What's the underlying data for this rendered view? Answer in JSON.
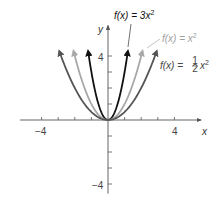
{
  "chart_data": {
    "type": "line",
    "title": "",
    "xlabel": "x",
    "ylabel": "y",
    "xlim": [
      -5.3,
      5.6
    ],
    "ylim": [
      -4.6,
      5.9
    ],
    "x_ticks": [
      -4,
      -3,
      -2,
      -1,
      1,
      2,
      3,
      4
    ],
    "y_ticks": [
      -4,
      -3,
      -2,
      -1,
      1,
      2,
      3,
      4
    ],
    "x_tick_labels": [
      {
        "value": -4,
        "label": "−4"
      },
      {
        "value": 4,
        "label": "4"
      }
    ],
    "y_tick_labels": [
      {
        "value": 4,
        "label": "4"
      },
      {
        "value": -4,
        "label": "−4"
      }
    ],
    "grid": false,
    "y_max_plotted": 4.3,
    "series": [
      {
        "name": "f(x) = 3x²",
        "coefficient": 3,
        "color": "#111111",
        "arrows": true
      },
      {
        "name": "f(x) = x²",
        "coefficient": 1,
        "color": "#a8a8a8",
        "arrows": true
      },
      {
        "name": "f(x) = ½x²",
        "coefficient": 0.5,
        "color": "#555555",
        "arrows": true
      }
    ],
    "annotations": [
      {
        "text_main": "f(x) = 3x",
        "superscript": "2",
        "color": "#111111",
        "series": 0
      },
      {
        "text_main": "f(x) = x",
        "superscript": "2",
        "color": "#a0a0a0",
        "series": 1
      },
      {
        "text_prefix": "f(x) = ",
        "fraction_num": "1",
        "fraction_den": "2",
        "text_suffix": "x",
        "superscript": "2",
        "color": "#444444",
        "series": 2
      }
    ]
  }
}
